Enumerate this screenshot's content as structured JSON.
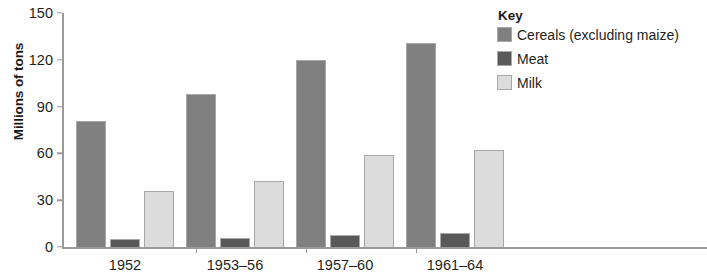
{
  "chart_data": {
    "type": "bar",
    "title": "",
    "xlabel": "",
    "ylabel": "Millions of tons",
    "ylim": [
      0,
      150
    ],
    "yticks": [
      0,
      30,
      60,
      90,
      120,
      150
    ],
    "grid": false,
    "legend_position": "right",
    "legend_title": "Key",
    "categories": [
      "1952",
      "1953–56",
      "1957–60",
      "1961–64"
    ],
    "series": [
      {
        "name": "Cereals (excluding maize)",
        "color": "#808080",
        "values": [
          81,
          98,
          120,
          131
        ]
      },
      {
        "name": "Meat",
        "color": "#595959",
        "values": [
          5,
          6,
          8,
          9
        ]
      },
      {
        "name": "Milk",
        "color": "#dcdcdc",
        "values": [
          36,
          42,
          59,
          62
        ]
      }
    ]
  },
  "axis": {
    "tick_labels": [
      "0",
      "30",
      "60",
      "90",
      "120",
      "150"
    ]
  },
  "colors": {
    "axis": "#9a9a9a",
    "text": "#231f20",
    "bar_border": "#a8a8a8"
  }
}
